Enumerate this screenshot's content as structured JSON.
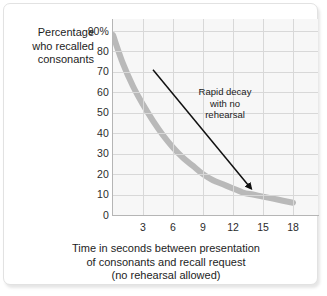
{
  "figure": {
    "y_axis_title_lines": [
      "Percentage",
      "who recalled",
      "consonants"
    ],
    "x_axis_caption_lines": [
      "Time in seconds between presentation",
      "of consonants and recall request",
      "(no rehearsal allowed)"
    ],
    "annotation_lines": [
      "Rapid decay",
      "with no",
      "rehearsal"
    ],
    "colors": {
      "curve": "#b9b9b9",
      "plot_background": "#f7f7f7",
      "gridline": "#d8d8d8",
      "axis": "#b5b5b5",
      "text": "#1d1d1d",
      "arrow": "#111111",
      "card_border": "#e2e2e2"
    }
  },
  "chart_data": {
    "type": "line",
    "title": "",
    "subtitle": "",
    "xlabel": "Time in seconds between presentation of consonants and recall request (no rehearsal allowed)",
    "ylabel": "Percentage who recalled consonants",
    "xlim": [
      0,
      20
    ],
    "ylim": [
      0,
      90
    ],
    "grid": true,
    "legend": "none",
    "xticks": [
      3,
      6,
      9,
      12,
      15,
      18
    ],
    "xtick_labels": [
      "3",
      "6",
      "9",
      "12",
      "15",
      "18"
    ],
    "yticks": [
      0,
      10,
      20,
      30,
      40,
      50,
      60,
      70,
      80,
      90
    ],
    "ytick_labels": [
      "0",
      "10",
      "20",
      "30",
      "40",
      "50",
      "60",
      "70",
      "80",
      "90%"
    ],
    "series": [
      {
        "name": "Percentage who recalled consonants",
        "color": "#b9b9b9",
        "x": [
          0,
          1,
          2,
          3,
          4,
          5,
          6,
          7,
          8,
          9,
          10,
          11,
          12,
          13,
          14,
          15,
          16,
          17,
          18
        ],
        "values": [
          88,
          74,
          63,
          54,
          46,
          39,
          33,
          28,
          24,
          20,
          17,
          15,
          13,
          11,
          10,
          9,
          8,
          7,
          6
        ]
      }
    ],
    "annotations": [
      {
        "text": "Rapid decay with no rehearsal",
        "arrow_from": [
          4.0,
          71
        ],
        "arrow_to": [
          13.8,
          13
        ]
      }
    ]
  }
}
